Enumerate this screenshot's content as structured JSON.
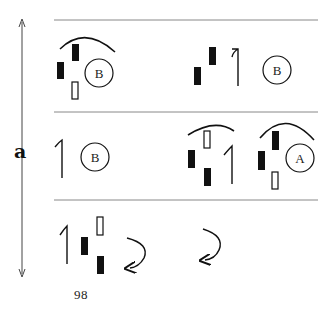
{
  "axis": {
    "label": "a",
    "direction": "vertical-double-arrow"
  },
  "rows": [
    {
      "index": 0,
      "groups": [
        {
          "name": "group-left",
          "items": [
            "arc",
            "filled-bar",
            "filled-bar",
            "hollow-bar",
            "circle-B"
          ]
        },
        {
          "name": "group-right",
          "items": [
            "filled-bar",
            "filled-bar",
            "hook-line",
            "circle-B"
          ]
        }
      ]
    },
    {
      "index": 1,
      "groups": [
        {
          "name": "group-left",
          "items": [
            "hook-line",
            "circle-B"
          ]
        },
        {
          "name": "group-middle",
          "items": [
            "arc",
            "hollow-bar",
            "filled-bar",
            "filled-bar",
            "hook-line"
          ]
        },
        {
          "name": "group-right",
          "items": [
            "arc",
            "filled-bar",
            "filled-bar",
            "hollow-bar",
            "circle-A"
          ]
        }
      ]
    },
    {
      "index": 2,
      "groups": [
        {
          "name": "group-left",
          "items": [
            "hook-line",
            "filled-bar",
            "hollow-bar",
            "filled-bar",
            "curved-arrow"
          ]
        },
        {
          "name": "group-right",
          "items": [
            "curved-arrow"
          ]
        }
      ]
    }
  ],
  "circles": {
    "row0_left": "B",
    "row0_right": "B",
    "row1_left": "B",
    "row1_right": "A"
  },
  "page_number": "98",
  "colors": {
    "ink": "#111111",
    "rule": "#888888",
    "background": "#ffffff"
  }
}
